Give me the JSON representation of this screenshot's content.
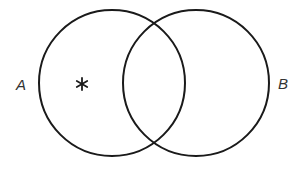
{
  "diagram": {
    "type": "venn",
    "sets": [
      {
        "id": "A",
        "label": "A",
        "cx": 112,
        "cy": 83,
        "r": 73
      },
      {
        "id": "B",
        "label": "B",
        "cx": 196,
        "cy": 83,
        "r": 73
      }
    ],
    "marker": {
      "symbol": "*",
      "region": "A only"
    },
    "stroke_color": "#1a1a1a",
    "background": "#ffffff"
  }
}
